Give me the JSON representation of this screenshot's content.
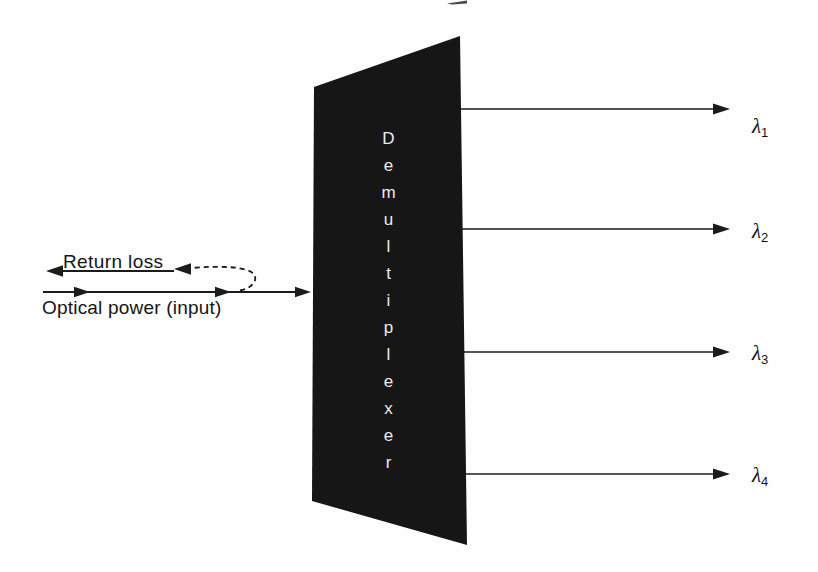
{
  "diagram": {
    "device": {
      "label": "Demultiplexer"
    },
    "input": {
      "label": "Optical power (input)"
    },
    "return_loss": {
      "label": "Return loss"
    },
    "outputs": [
      {
        "symbol": "λ",
        "subscript": "1"
      },
      {
        "symbol": "λ",
        "subscript": "2"
      },
      {
        "symbol": "λ",
        "subscript": "3"
      },
      {
        "symbol": "λ",
        "subscript": "4"
      }
    ],
    "colors": {
      "background": "#fefefe",
      "device_fill": "#161616",
      "device_text": "#ececec",
      "line": "#1b1b1b"
    }
  }
}
